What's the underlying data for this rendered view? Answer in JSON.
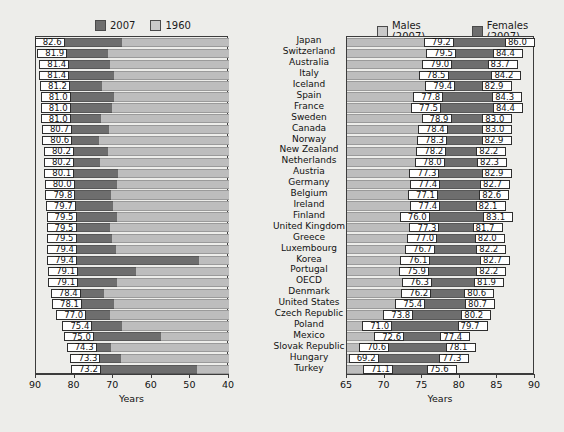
{
  "chart_data": {
    "type": "bar",
    "title": "",
    "panels": [
      {
        "id": "left",
        "xlabel": "Years",
        "xlim": [
          90,
          40
        ],
        "reversed": true,
        "ticks": [
          90,
          80,
          70,
          60,
          50,
          40
        ],
        "grid": false,
        "legend": [
          {
            "label": "2007",
            "color": "#6e6e6e"
          },
          {
            "label": "1960",
            "color": "#c9c9c9"
          }
        ],
        "series": [
          {
            "name": "2007",
            "values": [
              82.6,
              81.9,
              81.4,
              81.4,
              81.2,
              81.0,
              81.0,
              81.0,
              80.7,
              80.6,
              80.2,
              80.2,
              80.1,
              80.0,
              79.8,
              79.7,
              79.5,
              79.5,
              79.5,
              79.4,
              79.4,
              79.1,
              79.1,
              78.4,
              78.1,
              77.0,
              75.4,
              75.0,
              74.3,
              73.3,
              73.2
            ]
          },
          {
            "name": "1960",
            "values": [
              67.8,
              71.3,
              70.9,
              69.8,
              72.9,
              69.8,
              70.3,
              73.1,
              71.1,
              73.6,
              71.3,
              73.5,
              68.7,
              69.1,
              70.6,
              70.0,
              69.0,
              70.9,
              70.4,
              69.4,
              47.7,
              64.0,
              69.0,
              72.4,
              69.9,
              70.7,
              67.8,
              57.5,
              70.6,
              68.0,
              48.3
            ]
          }
        ]
      },
      {
        "id": "right",
        "xlabel": "Years",
        "xlim": [
          65,
          90
        ],
        "reversed": false,
        "ticks": [
          65,
          70,
          75,
          80,
          85,
          90
        ],
        "grid": false,
        "legend": [
          {
            "label": "Males (2007)",
            "color": "#c9c9c9"
          },
          {
            "label": "Females (2007)",
            "color": "#6e6e6e"
          }
        ],
        "series": [
          {
            "name": "Males (2007)",
            "values": [
              79.2,
              79.5,
              79.0,
              78.5,
              79.4,
              77.8,
              77.5,
              78.9,
              78.4,
              78.3,
              78.2,
              78.0,
              77.3,
              77.4,
              77.1,
              77.4,
              76.0,
              77.3,
              77.0,
              76.7,
              76.1,
              75.9,
              76.3,
              76.2,
              75.4,
              73.8,
              71.0,
              72.6,
              70.6,
              69.2,
              71.1
            ]
          },
          {
            "name": "Females (2007)",
            "values": [
              86.0,
              84.4,
              83.7,
              84.2,
              82.9,
              84.3,
              84.4,
              83.0,
              83.0,
              82.9,
              82.2,
              82.3,
              82.9,
              82.7,
              82.6,
              82.1,
              83.1,
              81.7,
              82.0,
              82.2,
              82.7,
              82.2,
              81.9,
              80.6,
              80.7,
              80.2,
              79.7,
              77.4,
              78.1,
              77.3,
              75.6
            ]
          }
        ]
      }
    ],
    "categories": [
      "Japan",
      "Switzerland",
      "Australia",
      "Italy",
      "Iceland",
      "Spain",
      "France",
      "Sweden",
      "Canada",
      "Norway",
      "New Zealand",
      "Netherlands",
      "Austria",
      "Germany",
      "Belgium",
      "Ireland",
      "Finland",
      "United Kingdom",
      "Greece",
      "Luxembourg",
      "Korea",
      "Portugal",
      "OECD",
      "Denmark",
      "United States",
      "Czech Republic",
      "Poland",
      "Mexico",
      "Slovak Republic",
      "Hungary",
      "Turkey"
    ],
    "left_labels": [
      "82.6",
      "81.9",
      "81.4",
      "81.4",
      "81.2",
      "81.0",
      "81.0",
      "81.0",
      "80.7",
      "80.6",
      "80.2",
      "80.2",
      "80.1",
      "80.0",
      "79.8",
      "79.7",
      "79.5",
      "79.5",
      "79.5",
      "79.4",
      "79.4",
      "79.1",
      "79.1",
      "78.4",
      "78.1",
      "77.0",
      "75.4",
      "75.0",
      "74.3",
      "73.3",
      "73.2"
    ],
    "right_male_labels": [
      "79.2",
      "79.5",
      "79.0",
      "78.5",
      "79.4",
      "77.8",
      "77.5",
      "78.9",
      "78.4",
      "78.3",
      "78.2",
      "78.0",
      "77.3",
      "77.4",
      "77.1",
      "77.4",
      "76.0",
      "77.3",
      "77.0",
      "76.7",
      "76.1",
      "75.9",
      "76.3",
      "76.2",
      "75.4",
      "73.8",
      "71.0",
      "72.6",
      "70.6",
      "69.2",
      "71.1"
    ],
    "right_female_labels": [
      "86.0",
      "84.4",
      "83.7",
      "84.2",
      "82.9",
      "84.3",
      "84.4",
      "83.0",
      "83.0",
      "82.9",
      "82.2",
      "82.3",
      "82.9",
      "82.7",
      "82.6",
      "82.1",
      "83.1",
      "81.7",
      "82.0",
      "82.2",
      "82.7",
      "82.2",
      "81.9",
      "80.6",
      "80.7",
      "80.2",
      "79.7",
      "77.4",
      "78.1",
      "77.3",
      "75.6"
    ],
    "colors": {
      "dark": "#6e6e6e",
      "light": "#bdbdbd",
      "background": "#ededea",
      "frame": "#3c3c3c",
      "label_box": "#ffffff"
    }
  },
  "axis_left": {
    "title": "Years",
    "tick_labels": [
      "90",
      "80",
      "70",
      "60",
      "50",
      "40"
    ]
  },
  "axis_right": {
    "title": "Years",
    "tick_labels": [
      "65",
      "70",
      "75",
      "80",
      "85",
      "90"
    ]
  },
  "legend_left": {
    "entry0": "2007",
    "entry1": "1960"
  },
  "legend_right": {
    "entry0": "Males (2007)",
    "entry1": "Females (2007)"
  }
}
